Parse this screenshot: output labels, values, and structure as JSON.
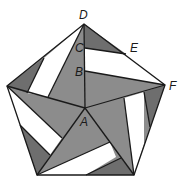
{
  "diagram": {
    "type": "geometric-figure",
    "colors": {
      "gray": "#8c8c8c",
      "dark_gray": "#6e6e6e",
      "white": "#ffffff",
      "stroke": "#1a1a1a"
    },
    "labels": {
      "A": "A",
      "B": "B",
      "C": "C",
      "D": "D",
      "E": "E",
      "F": "F"
    },
    "points": {
      "A": [
        85,
        108
      ],
      "B": [
        85,
        71
      ],
      "C": [
        85,
        48
      ],
      "D": [
        84,
        24
      ],
      "E": [
        126,
        54
      ],
      "F": [
        165,
        85
      ]
    }
  }
}
